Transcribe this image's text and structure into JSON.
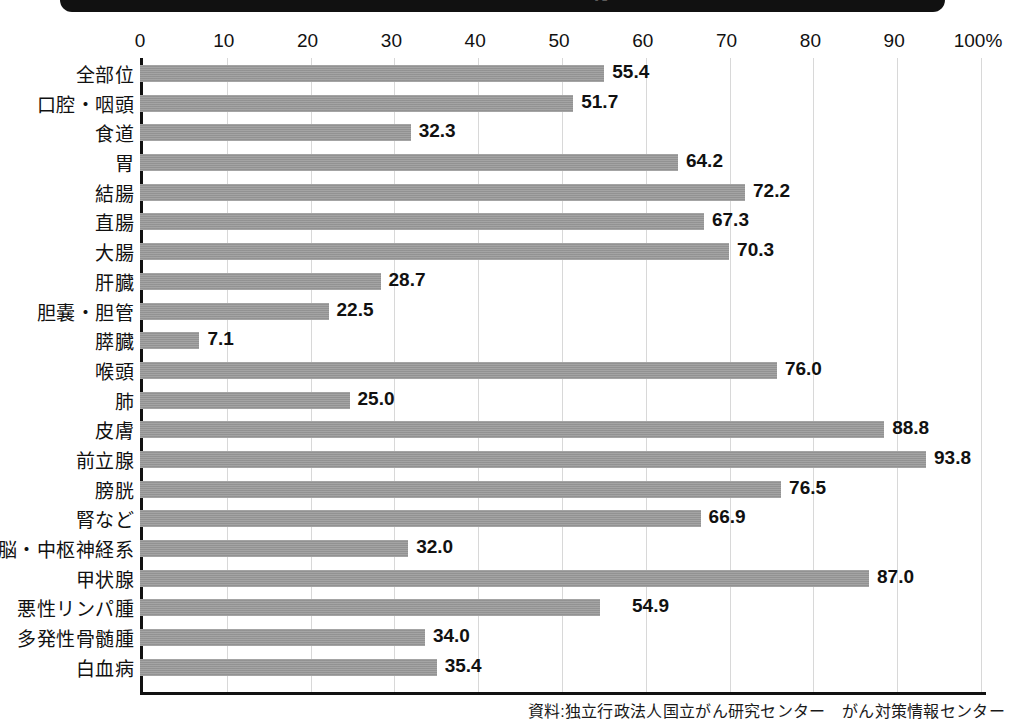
{
  "title": {
    "text": "部位別　5年相対生存率",
    "banner_color": "#111111"
  },
  "axis": {
    "ticks": [
      "0",
      "10",
      "20",
      "30",
      "40",
      "50",
      "60",
      "70",
      "80",
      "90",
      "100%"
    ],
    "min": 0,
    "max": 100
  },
  "source": {
    "text": "資料:独立行政法人国立がん研究センター　がん対策情報センター"
  },
  "style": {
    "bar_color": "#9a9a9a",
    "axis_color": "#111111",
    "grid_color": "#d8d8d8",
    "background": "#ffffff"
  },
  "chart_data": {
    "type": "bar",
    "orientation": "horizontal",
    "title": "部位別　5年相対生存率",
    "xlabel": "",
    "ylabel": "",
    "xlim": [
      0,
      100
    ],
    "grid": true,
    "legend": "none",
    "unit": "%",
    "categories": [
      "全部位",
      "口腔・咽頭",
      "食道",
      "胃",
      "結腸",
      "直腸",
      "大腸",
      "肝臓",
      "胆嚢・胆管",
      "膵臓",
      "喉頭",
      "肺",
      "皮膚",
      "前立腺",
      "膀胱",
      "腎など",
      "脳・中枢神経系",
      "甲状腺",
      "悪性リンパ腫",
      "多発性骨髄腫",
      "白血病"
    ],
    "values": [
      55.4,
      51.7,
      32.3,
      64.2,
      72.2,
      67.3,
      70.3,
      28.7,
      22.5,
      7.1,
      76.0,
      25.0,
      88.8,
      93.8,
      76.5,
      66.9,
      32.0,
      87.0,
      54.9,
      34.0,
      35.4
    ],
    "value_labels": [
      "55.4",
      "51.7",
      "32.3",
      "64.2",
      "72.2",
      "67.3",
      "70.3",
      "28.7",
      "22.5",
      "7.1",
      "76.0",
      "25.0",
      "88.8",
      "93.8",
      "76.5",
      "66.9",
      "32.0",
      "87.0",
      "54.9",
      "34.0",
      "35.4"
    ]
  }
}
